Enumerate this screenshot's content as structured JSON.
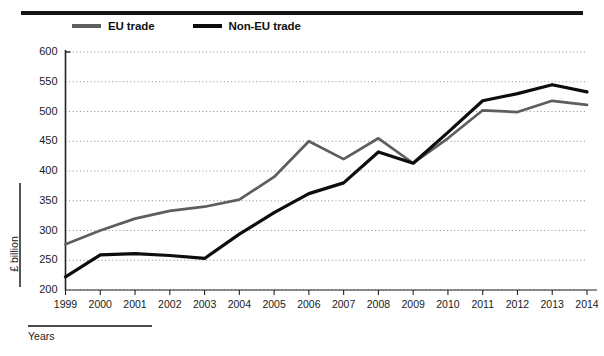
{
  "figure": {
    "top_rule": "horizontal-rule",
    "legend": [
      {
        "label": "EU trade",
        "color": "#5e5e5e",
        "swatch": "line-swatch-eu"
      },
      {
        "label": "Non-EU trade",
        "color": "#0d0d0d",
        "swatch": "line-swatch-non-eu"
      }
    ],
    "y_axis_title": "£ billion",
    "x_axis_title": "Years"
  },
  "chart_data": {
    "type": "line",
    "title": "",
    "subtitle": "",
    "xlabel": "Years",
    "ylabel": "£ billion",
    "categories": [
      "1999",
      "2000",
      "2001",
      "2002",
      "2003",
      "2004",
      "2005",
      "2006",
      "2007",
      "2008",
      "2009",
      "2010",
      "2011",
      "2012",
      "2013",
      "2014"
    ],
    "x": [
      1999,
      2000,
      2001,
      2002,
      2003,
      2004,
      2005,
      2006,
      2007,
      2008,
      2009,
      2010,
      2011,
      2012,
      2013,
      2014
    ],
    "ylim": [
      200,
      600
    ],
    "xlim": [
      1999,
      2014
    ],
    "ytick_values": [
      200,
      250,
      300,
      350,
      400,
      450,
      500,
      550,
      600
    ],
    "ytick_labels": [
      "200",
      "250",
      "300",
      "350",
      "400",
      "450",
      "500",
      "550",
      "600"
    ],
    "ytick_step": 50,
    "grid": true,
    "grid_style": "dotted-horizontal",
    "legend_position": "top",
    "series": [
      {
        "name": "EU trade",
        "color": "#5e5e5e",
        "values": [
          277,
          300,
          320,
          333,
          340,
          352,
          390,
          450,
          420,
          455,
          413,
          455,
          502,
          499,
          518,
          511
        ]
      },
      {
        "name": "Non-EU trade",
        "color": "#0d0d0d",
        "values": [
          222,
          259,
          261,
          258,
          253,
          294,
          330,
          362,
          380,
          432,
          413,
          465,
          518,
          530,
          545,
          533
        ]
      }
    ]
  }
}
